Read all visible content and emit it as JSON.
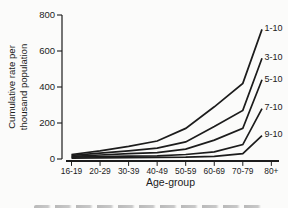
{
  "figure": {
    "caption_partial": "Fig.",
    "text_color": "#1c1c1c",
    "background": "#fbfbfa"
  },
  "chart_data": {
    "type": "line",
    "title": "",
    "xlabel": "Age-group",
    "ylabel_line1": "Cumulative rate per",
    "ylabel_line2": "thousand population",
    "categories": [
      "16-19",
      "20-29",
      "30-39",
      "40-49",
      "50-59",
      "60-69",
      "70-79",
      "80+"
    ],
    "ylim": [
      0,
      800
    ],
    "yticks": [
      0,
      200,
      400,
      600,
      800
    ],
    "grid": false,
    "legend_position": "line-end-labels-right",
    "line_color": "#1c1c1c",
    "series": [
      {
        "name": "1-10",
        "values": [
          25,
          45,
          70,
          100,
          170,
          290,
          420,
          720
        ]
      },
      {
        "name": "3-10",
        "values": [
          20,
          32,
          45,
          60,
          95,
          180,
          270,
          560
        ]
      },
      {
        "name": "5-10",
        "values": [
          15,
          22,
          30,
          35,
          55,
          105,
          170,
          440
        ]
      },
      {
        "name": "7-10",
        "values": [
          10,
          13,
          16,
          18,
          25,
          40,
          80,
          280
        ]
      },
      {
        "name": "9-10",
        "values": [
          5,
          6,
          8,
          9,
          10,
          15,
          30,
          130
        ]
      }
    ]
  }
}
